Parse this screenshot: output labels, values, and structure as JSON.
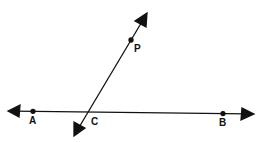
{
  "diagram": {
    "lines": [
      {
        "name": "line-AB",
        "from": [
          8,
          111
        ],
        "to": [
          253,
          114
        ],
        "arrows": "both"
      },
      {
        "name": "line-PC",
        "from": [
          147,
          13
        ],
        "to": [
          74,
          136
        ],
        "arrows": "both"
      }
    ],
    "points": [
      {
        "label": "A",
        "x": 33,
        "y": 111,
        "label_x": 29,
        "label_y": 116
      },
      {
        "label": "B",
        "x": 223,
        "y": 113,
        "label_x": 219,
        "label_y": 118
      },
      {
        "label": "P",
        "x": 131,
        "y": 40,
        "label_x": 134,
        "label_y": 43
      },
      {
        "label": "C",
        "x": 89,
        "y": 112,
        "label_x": 91,
        "label_y": 117
      }
    ],
    "colors": {
      "ink": "#111111",
      "background": "#ffffff"
    }
  }
}
